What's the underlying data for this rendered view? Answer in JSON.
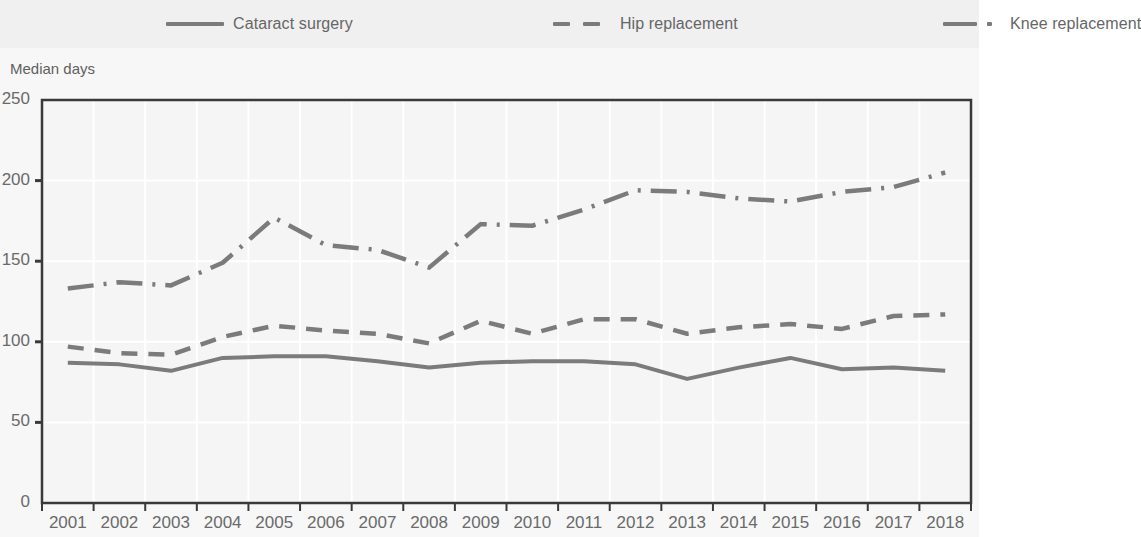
{
  "legend": {
    "items": [
      {
        "label": "Cataract surgery",
        "style": "solid",
        "color": "#7b7b7b",
        "icon": "line-solid-icon"
      },
      {
        "label": "Hip replacement",
        "style": "dashed",
        "color": "#7b7b7b",
        "icon": "line-dashed-icon"
      },
      {
        "label": "Knee replacement",
        "style": "dashdot",
        "color": "#7b7b7b",
        "icon": "line-dashdot-icon"
      }
    ]
  },
  "axis_title": "Median days",
  "chart_data": {
    "type": "line",
    "title": "",
    "subtitle": "",
    "xlabel": "",
    "ylabel": "Median days",
    "ylim": [
      0,
      250
    ],
    "yticks": [
      0,
      50,
      100,
      150,
      200,
      250
    ],
    "grid": true,
    "legend_position": "top",
    "x": [
      "2001",
      "2002",
      "2003",
      "2004",
      "2005",
      "2006",
      "2007",
      "2008",
      "2009",
      "2010",
      "2011",
      "2012",
      "2013",
      "2014",
      "2015",
      "2016",
      "2017",
      "2018"
    ],
    "categories": [
      "2001",
      "2002",
      "2003",
      "2004",
      "2005",
      "2006",
      "2007",
      "2008",
      "2009",
      "2010",
      "2011",
      "2012",
      "2013",
      "2014",
      "2015",
      "2016",
      "2017",
      "2018"
    ],
    "series": [
      {
        "name": "Cataract surgery",
        "style": "solid",
        "color": "#7b7b7b",
        "values": [
          87,
          86,
          82,
          90,
          91,
          91,
          88,
          84,
          87,
          88,
          88,
          86,
          77,
          84,
          90,
          83,
          84,
          82
        ]
      },
      {
        "name": "Hip replacement",
        "style": "dashed",
        "color": "#7b7b7b",
        "values": [
          97,
          93,
          92,
          103,
          110,
          107,
          105,
          99,
          113,
          105,
          114,
          114,
          105,
          109,
          111,
          108,
          116,
          117
        ]
      },
      {
        "name": "Knee replacement",
        "style": "dashdot",
        "color": "#7b7b7b",
        "values": [
          133,
          137,
          135,
          149,
          177,
          160,
          157,
          146,
          173,
          172,
          182,
          194,
          193,
          189,
          187,
          193,
          196,
          205
        ]
      }
    ]
  }
}
